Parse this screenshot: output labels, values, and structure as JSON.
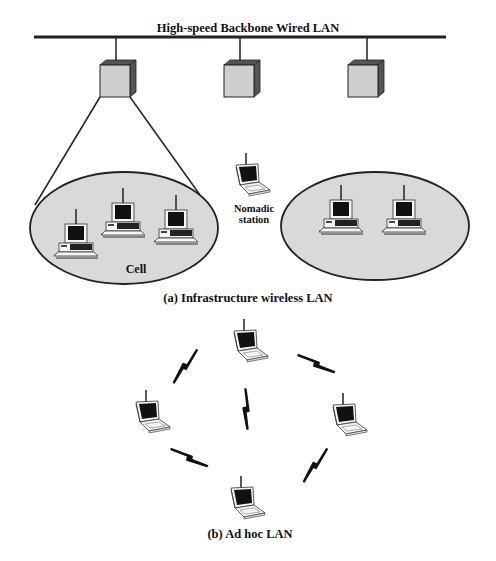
{
  "figure": {
    "infrastructure": {
      "backbone_label": "High-speed Backbone Wired LAN",
      "access_points": [
        {
          "id": "ap-1",
          "x": 116
        },
        {
          "id": "ap-2",
          "x": 240
        },
        {
          "id": "ap-3",
          "x": 364
        }
      ],
      "cells": [
        {
          "id": "cell-left",
          "label": "Cell",
          "stations": 3
        },
        {
          "id": "cell-right",
          "label": "",
          "stations": 2
        }
      ],
      "nomadic_station": {
        "line1": "Nomadic",
        "line2": "station"
      },
      "caption": "(a) Infrastructure wireless LAN"
    },
    "adhoc": {
      "stations": 4,
      "wireless_links": 5,
      "caption": "(b) Ad hoc LAN"
    }
  },
  "colors": {
    "line": "#222222",
    "box_front": "#cfcfcf",
    "box_side": "#555555",
    "cell_fill": "#d9d9d9",
    "screen": "#111111"
  }
}
